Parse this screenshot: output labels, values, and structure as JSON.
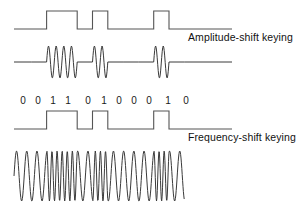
{
  "figure": {
    "bit_sequence": [
      "0",
      "0",
      "1",
      "1",
      "0",
      "1",
      "0",
      "0",
      "0",
      "1",
      "0"
    ],
    "bit_positions_px": [
      23,
      38,
      53,
      68,
      88,
      104,
      119,
      134,
      149,
      168,
      186
    ],
    "stroke_color": "#3a3a3a",
    "square_stroke_color": "#555555",
    "background_color": "#ffffff",
    "rows": [
      {
        "name": "digital-signal-top",
        "kind": "square",
        "baseline_y": 29,
        "high_y": 11,
        "x_start": 14,
        "x_end": 232,
        "bit_width": 15.3,
        "first_bit_x": 16
      },
      {
        "name": "ask-carrier",
        "kind": "ask",
        "baseline_y": 62,
        "amplitude": 16,
        "x_start": 14,
        "x_end": 232,
        "cycles_per_bit": 2
      },
      {
        "name": "digital-signal-bottom",
        "kind": "square",
        "baseline_y": 129,
        "high_y": 111,
        "x_start": 14,
        "x_end": 232,
        "bit_width": 15.3,
        "first_bit_x": 16
      },
      {
        "name": "fsk-carrier",
        "kind": "fsk",
        "baseline_y": 176,
        "amplitude": 25,
        "x_start": 14,
        "x_end": 232,
        "cycles_low": 1.5,
        "cycles_high": 3
      }
    ]
  },
  "labels": {
    "ask": "Amplitude-shift keying",
    "fsk": "Frequency-shift keying"
  }
}
